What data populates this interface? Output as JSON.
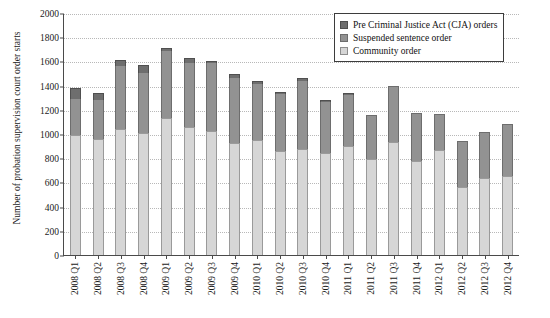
{
  "chart_data": {
    "type": "bar",
    "title": "",
    "subtitle": "",
    "stacked": true,
    "xlabel": "",
    "ylabel": "Number of probation supervision court order starts",
    "ylim": [
      0,
      2000
    ],
    "yticks": [
      0,
      200,
      400,
      600,
      800,
      1000,
      1200,
      1400,
      1600,
      1800,
      2000
    ],
    "grid": true,
    "legend_position": "top-right",
    "categories": [
      "2008 Q1",
      "2008 Q2",
      "2008 Q3",
      "2008 Q4",
      "2009 Q1",
      "2009 Q2",
      "2009 Q3",
      "2009 Q4",
      "2010 Q1",
      "2010 Q2",
      "2010 Q3",
      "2010 Q4",
      "2011 Q1",
      "2011 Q2",
      "2011 Q3",
      "2011 Q4",
      "2012 Q1",
      "2012 Q2",
      "2012 Q3",
      "2012 Q4"
    ],
    "series": [
      {
        "name": "Community order",
        "color": "#d6d6d6",
        "values": [
          990,
          960,
          1040,
          1005,
          1130,
          1060,
          1025,
          925,
          950,
          860,
          880,
          840,
          905,
          790,
          935,
          780,
          865,
          560,
          640,
          650
        ]
      },
      {
        "name": "Suspended sentence order",
        "color": "#929292",
        "values": [
          300,
          320,
          520,
          500,
          560,
          530,
          560,
          540,
          460,
          470,
          555,
          425,
          420,
          370,
          465,
          390,
          300,
          385,
          380,
          435
        ]
      },
      {
        "name": "Pre Criminal Justice Act (CJA) orders",
        "color": "#6e6e6e",
        "values": [
          90,
          55,
          55,
          65,
          20,
          35,
          15,
          35,
          25,
          20,
          25,
          15,
          15,
          0,
          0,
          0,
          0,
          0,
          0,
          0
        ]
      }
    ],
    "totals": [
      1380,
      1335,
      1615,
      1570,
      1710,
      1625,
      1600,
      1500,
      1435,
      1350,
      1460,
      1280,
      1340,
      1160,
      1400,
      1170,
      1165,
      945,
      1020,
      1085
    ]
  },
  "legend": {
    "items": [
      {
        "label": "Pre Criminal Justice Act (CJA) orders",
        "swatch": "dark-square-icon"
      },
      {
        "label": "Suspended sentence order",
        "swatch": "mid-square-icon"
      },
      {
        "label": "Community order",
        "swatch": "light-square-icon"
      }
    ]
  }
}
